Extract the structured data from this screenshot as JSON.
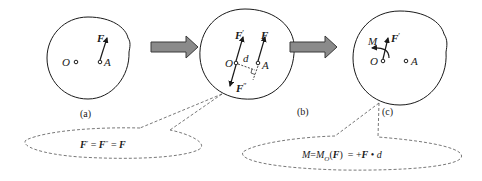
{
  "diagram": {
    "colors": {
      "stroke": "#1a1a1a",
      "arrow_fill": "#8a8a8a",
      "arrow_stroke": "#3a3a3a",
      "dashed": "#555555",
      "background": "#ffffff"
    },
    "panels": [
      {
        "id": "a",
        "caption": "(a)",
        "points": [
          {
            "label": "O"
          },
          {
            "label": "A"
          }
        ],
        "forces": [
          {
            "label": "F",
            "at": "A",
            "direction": "up"
          }
        ]
      },
      {
        "id": "b",
        "caption": "(b)",
        "points": [
          {
            "label": "O"
          },
          {
            "label": "A"
          }
        ],
        "forces": [
          {
            "label": "F",
            "prime": "",
            "at": "A",
            "direction": "up"
          },
          {
            "label": "F",
            "prime": "′",
            "at": "O",
            "direction": "up"
          },
          {
            "label": "F",
            "prime": "″",
            "at": "O",
            "direction": "down"
          }
        ],
        "distance_label": "d"
      },
      {
        "id": "c",
        "caption": "(c)",
        "points": [
          {
            "label": "O"
          },
          {
            "label": "A"
          }
        ],
        "forces": [
          {
            "label": "F",
            "prime": "′",
            "at": "O",
            "direction": "up"
          }
        ],
        "moment_label": "M"
      }
    ],
    "transition_arrows": [
      {
        "from": "a",
        "to": "b"
      },
      {
        "from": "b",
        "to": "c"
      }
    ],
    "callouts": [
      {
        "points_to": "b",
        "equation": {
          "parts": [
            "F",
            "′",
            " = ",
            "F",
            "″",
            " = ",
            "F"
          ]
        }
      },
      {
        "points_to": "c",
        "equation": {
          "parts": [
            "M",
            "=",
            "M",
            "O",
            "(",
            "F",
            ")",
            "  = +",
            "F",
            " • ",
            "d"
          ]
        }
      }
    ]
  }
}
